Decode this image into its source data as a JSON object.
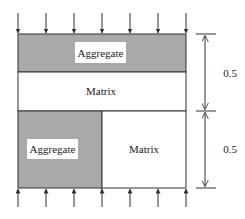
{
  "diagram": {
    "type": "composite-specimen-loading",
    "regions": {
      "top_aggregate": {
        "label": "Aggregate"
      },
      "middle_matrix": {
        "label": "Matrix"
      },
      "bottom_left_aggregate": {
        "label": "Aggregate"
      },
      "bottom_right_matrix": {
        "label": "Matrix"
      }
    },
    "dimensions": {
      "upper": {
        "label": "0.5"
      },
      "lower": {
        "label": "0.5"
      }
    },
    "loads": {
      "top_arrow_count": 7,
      "bottom_arrow_count": 7,
      "top_direction": "down",
      "bottom_direction": "up"
    },
    "colors": {
      "aggregate": "#a9a9a9",
      "matrix": "#ffffff",
      "line": "#333333",
      "label_box": "#ffffff"
    }
  }
}
